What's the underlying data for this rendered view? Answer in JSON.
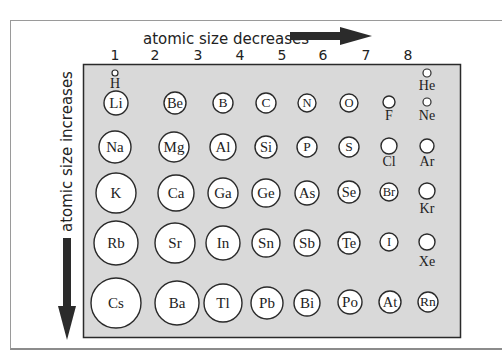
{
  "diagram": {
    "title_horizontal": "atomic size decreases",
    "title_vertical": "atomic size increases",
    "group_labels": [
      "1",
      "2",
      "3",
      "4",
      "5",
      "6",
      "7",
      "8"
    ],
    "colors": {
      "box_fill": "#d9d9d9",
      "stroke": "#2a2a2a",
      "arrow": "#2b2b2b",
      "circle_fill": "#ffffff"
    },
    "elements": [
      {
        "symbol": "H",
        "cx": 115,
        "cy": 73,
        "r": 3,
        "label_pos": "below",
        "ly": 88
      },
      {
        "symbol": "He",
        "cx": 427,
        "cy": 73,
        "r": 4,
        "label_pos": "below",
        "ly": 90
      },
      {
        "symbol": "Li",
        "cx": 116,
        "cy": 103,
        "r": 12,
        "label_pos": "inside"
      },
      {
        "symbol": "Be",
        "cx": 175,
        "cy": 103,
        "r": 11,
        "label_pos": "inside"
      },
      {
        "symbol": "B",
        "cx": 223,
        "cy": 103,
        "r": 10,
        "label_pos": "inside"
      },
      {
        "symbol": "C",
        "cx": 266,
        "cy": 103,
        "r": 10,
        "label_pos": "inside"
      },
      {
        "symbol": "N",
        "cx": 307,
        "cy": 103,
        "r": 9,
        "label_pos": "inside"
      },
      {
        "symbol": "O",
        "cx": 349,
        "cy": 103,
        "r": 9,
        "label_pos": "inside"
      },
      {
        "symbol": "F",
        "cx": 389,
        "cy": 102,
        "r": 6,
        "label_pos": "below",
        "ly": 120
      },
      {
        "symbol": "Ne",
        "cx": 427,
        "cy": 102,
        "r": 4,
        "label_pos": "below",
        "ly": 120
      },
      {
        "symbol": "Na",
        "cx": 115,
        "cy": 147,
        "r": 16,
        "label_pos": "inside"
      },
      {
        "symbol": "Mg",
        "cx": 174,
        "cy": 147,
        "r": 15,
        "label_pos": "inside"
      },
      {
        "symbol": "Al",
        "cx": 223,
        "cy": 147,
        "r": 13,
        "label_pos": "inside"
      },
      {
        "symbol": "Si",
        "cx": 266,
        "cy": 147,
        "r": 11,
        "label_pos": "inside"
      },
      {
        "symbol": "P",
        "cx": 307,
        "cy": 147,
        "r": 10,
        "label_pos": "inside"
      },
      {
        "symbol": "S",
        "cx": 349,
        "cy": 147,
        "r": 10,
        "label_pos": "inside"
      },
      {
        "symbol": "Cl",
        "cx": 389,
        "cy": 146,
        "r": 8,
        "label_pos": "below",
        "ly": 166
      },
      {
        "symbol": "Ar",
        "cx": 427,
        "cy": 146,
        "r": 7,
        "label_pos": "below",
        "ly": 166
      },
      {
        "symbol": "K",
        "cx": 116,
        "cy": 193,
        "r": 20,
        "label_pos": "inside"
      },
      {
        "symbol": "Ca",
        "cx": 176,
        "cy": 193,
        "r": 18,
        "label_pos": "inside"
      },
      {
        "symbol": "Ga",
        "cx": 223,
        "cy": 193,
        "r": 15,
        "label_pos": "inside"
      },
      {
        "symbol": "Ge",
        "cx": 266,
        "cy": 193,
        "r": 14,
        "label_pos": "inside"
      },
      {
        "symbol": "As",
        "cx": 307,
        "cy": 193,
        "r": 12,
        "label_pos": "inside"
      },
      {
        "symbol": "Se",
        "cx": 349,
        "cy": 192,
        "r": 11,
        "label_pos": "inside"
      },
      {
        "symbol": "Br",
        "cx": 389,
        "cy": 192,
        "r": 9,
        "label_pos": "inside"
      },
      {
        "symbol": "Kr",
        "cx": 427,
        "cy": 191,
        "r": 8,
        "label_pos": "below",
        "ly": 213
      },
      {
        "symbol": "Rb",
        "cx": 116,
        "cy": 243,
        "r": 22,
        "label_pos": "inside"
      },
      {
        "symbol": "Sr",
        "cx": 175,
        "cy": 243,
        "r": 20,
        "label_pos": "inside"
      },
      {
        "symbol": "In",
        "cx": 223,
        "cy": 243,
        "r": 17,
        "label_pos": "inside"
      },
      {
        "symbol": "Sn",
        "cx": 266,
        "cy": 243,
        "r": 14,
        "label_pos": "inside"
      },
      {
        "symbol": "Sb",
        "cx": 307,
        "cy": 243,
        "r": 13,
        "label_pos": "inside"
      },
      {
        "symbol": "Te",
        "cx": 349,
        "cy": 243,
        "r": 11,
        "label_pos": "inside"
      },
      {
        "symbol": "I",
        "cx": 389,
        "cy": 242,
        "r": 9,
        "label_pos": "inside"
      },
      {
        "symbol": "Xe",
        "cx": 427,
        "cy": 242,
        "r": 8,
        "label_pos": "below",
        "ly": 266
      },
      {
        "symbol": "Cs",
        "cx": 116,
        "cy": 303,
        "r": 25,
        "label_pos": "inside"
      },
      {
        "symbol": "Ba",
        "cx": 177,
        "cy": 303,
        "r": 22,
        "label_pos": "inside"
      },
      {
        "symbol": "Tl",
        "cx": 223,
        "cy": 303,
        "r": 19,
        "label_pos": "inside"
      },
      {
        "symbol": "Pb",
        "cx": 267,
        "cy": 303,
        "r": 16,
        "label_pos": "inside"
      },
      {
        "symbol": "Bi",
        "cx": 307,
        "cy": 303,
        "r": 13,
        "label_pos": "inside"
      },
      {
        "symbol": "Po",
        "cx": 350,
        "cy": 302,
        "r": 12,
        "label_pos": "inside"
      },
      {
        "symbol": "At",
        "cx": 390,
        "cy": 302,
        "r": 11,
        "label_pos": "inside"
      },
      {
        "symbol": "Rn",
        "cx": 428,
        "cy": 302,
        "r": 10,
        "label_pos": "inside"
      }
    ]
  }
}
